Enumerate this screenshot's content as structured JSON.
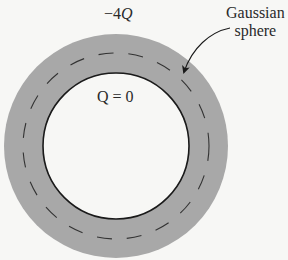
{
  "diagram": {
    "type": "gaussian-sphere-conducting-shell",
    "colors": {
      "background": "#f7f7f5",
      "shell_fill": "#a8a8a8",
      "inner_cavity": "#f7f7f5",
      "stroke": "#1a1a1a",
      "dash": "#333333",
      "text": "#2a2a2a"
    },
    "geometry": {
      "center_x": 116,
      "center_y": 146,
      "outer_radius": 112,
      "inner_radius": 73,
      "gaussian_radius": 93
    },
    "labels": {
      "outer_charge_prefix": "−4",
      "outer_charge_symbol": "Q",
      "inner_charge": "Q = 0",
      "gaussian_line1": "Gaussian",
      "gaussian_line2": "sphere"
    }
  }
}
